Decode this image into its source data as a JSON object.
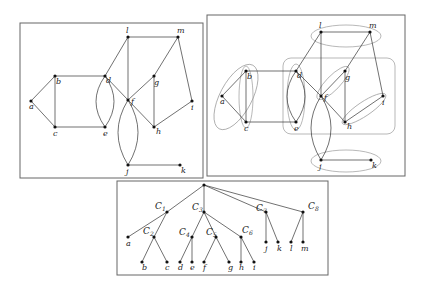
{
  "panels": {
    "left_graph": {
      "frame": {
        "x": 20,
        "y": 23,
        "w": 183,
        "h": 155
      },
      "nodes": [
        {
          "id": "a",
          "x": 31,
          "y": 101,
          "lx": -2,
          "ly": 8
        },
        {
          "id": "b",
          "x": 55,
          "y": 76,
          "lx": 1,
          "ly": 8
        },
        {
          "id": "c",
          "x": 55,
          "y": 127,
          "lx": -2,
          "ly": 9
        },
        {
          "id": "d",
          "x": 105,
          "y": 76,
          "lx": 1,
          "ly": 7
        },
        {
          "id": "e",
          "x": 105,
          "y": 127,
          "lx": -2,
          "ly": 9
        },
        {
          "id": "f",
          "x": 128,
          "y": 100,
          "lx": 3,
          "ly": 4
        },
        {
          "id": "g",
          "x": 154,
          "y": 76,
          "lx": 0,
          "ly": 9
        },
        {
          "id": "h",
          "x": 154,
          "y": 127,
          "lx": 2,
          "ly": 7
        },
        {
          "id": "i",
          "x": 192,
          "y": 101,
          "lx": -1,
          "ly": 9
        },
        {
          "id": "j",
          "x": 128,
          "y": 165,
          "lx": -2,
          "ly": 9
        },
        {
          "id": "k",
          "x": 180,
          "y": 165,
          "lx": 1,
          "ly": 8
        },
        {
          "id": "l",
          "x": 128,
          "y": 37,
          "lx": -2,
          "ly": -4
        },
        {
          "id": "m",
          "x": 178,
          "y": 37,
          "lx": -1,
          "ly": -4
        }
      ],
      "edges": [
        [
          "a",
          "b"
        ],
        [
          "a",
          "c"
        ],
        [
          "b",
          "c"
        ],
        [
          "b",
          "d"
        ],
        [
          "c",
          "e"
        ],
        [
          "d",
          "f"
        ],
        [
          "d",
          "l"
        ],
        [
          "l",
          "m"
        ],
        [
          "l",
          "f"
        ],
        [
          "f",
          "g"
        ],
        [
          "f",
          "h"
        ],
        [
          "g",
          "m"
        ],
        [
          "g",
          "h"
        ],
        [
          "h",
          "i"
        ],
        [
          "m",
          "i"
        ],
        [
          "j",
          "k"
        ]
      ],
      "curved_edges": [
        {
          "from": "d",
          "to": "e",
          "bend": -9
        },
        {
          "from": "d",
          "to": "e",
          "bend": 9
        },
        {
          "from": "f",
          "to": "j",
          "bend": -10
        },
        {
          "from": "f",
          "to": "j",
          "bend": 10
        }
      ]
    },
    "right_graph": {
      "frame": {
        "x": 207,
        "y": 15,
        "w": 198,
        "h": 161
      },
      "nodes": [
        {
          "id": "a",
          "x": 222,
          "y": 96,
          "lx": -2,
          "ly": 8
        },
        {
          "id": "b",
          "x": 246,
          "y": 71,
          "lx": 1,
          "ly": 8
        },
        {
          "id": "c",
          "x": 246,
          "y": 122,
          "lx": -2,
          "ly": 9
        },
        {
          "id": "d",
          "x": 296,
          "y": 71,
          "lx": 1,
          "ly": 7
        },
        {
          "id": "e",
          "x": 296,
          "y": 122,
          "lx": -2,
          "ly": 9
        },
        {
          "id": "f",
          "x": 321,
          "y": 96,
          "lx": 3,
          "ly": 4
        },
        {
          "id": "g",
          "x": 345,
          "y": 71,
          "lx": 0,
          "ly": 9
        },
        {
          "id": "h",
          "x": 345,
          "y": 122,
          "lx": 2,
          "ly": 7
        },
        {
          "id": "i",
          "x": 383,
          "y": 96,
          "lx": -1,
          "ly": 9
        },
        {
          "id": "j",
          "x": 321,
          "y": 160,
          "lx": -2,
          "ly": 9
        },
        {
          "id": "k",
          "x": 371,
          "y": 160,
          "lx": 1,
          "ly": 8
        },
        {
          "id": "l",
          "x": 321,
          "y": 32,
          "lx": -2,
          "ly": -4
        },
        {
          "id": "m",
          "x": 370,
          "y": 32,
          "lx": -1,
          "ly": -4
        }
      ],
      "edges": [
        [
          "a",
          "b"
        ],
        [
          "a",
          "c"
        ],
        [
          "b",
          "c"
        ],
        [
          "b",
          "d"
        ],
        [
          "c",
          "e"
        ],
        [
          "d",
          "f"
        ],
        [
          "d",
          "l"
        ],
        [
          "l",
          "m"
        ],
        [
          "l",
          "f"
        ],
        [
          "f",
          "g"
        ],
        [
          "f",
          "h"
        ],
        [
          "g",
          "m"
        ],
        [
          "g",
          "h"
        ],
        [
          "h",
          "i"
        ],
        [
          "m",
          "i"
        ],
        [
          "j",
          "k"
        ]
      ],
      "curved_edges": [
        {
          "from": "d",
          "to": "e",
          "bend": -9
        },
        {
          "from": "d",
          "to": "e",
          "bend": 9
        },
        {
          "from": "f",
          "to": "j",
          "bend": -10
        },
        {
          "from": "f",
          "to": "j",
          "bend": 10
        }
      ],
      "hulls": [
        {
          "type": "rect",
          "x": 283,
          "y": 58,
          "w": 112,
          "h": 76,
          "r": 8
        },
        {
          "type": "ellipse",
          "cx": 236,
          "cy": 97,
          "rx": 16,
          "ry": 36,
          "rot": 28
        },
        {
          "type": "ellipse",
          "cx": 246,
          "cy": 97,
          "rx": 7,
          "ry": 31,
          "rot": 0
        },
        {
          "type": "ellipse",
          "cx": 296,
          "cy": 97,
          "rx": 9,
          "ry": 33,
          "rot": 0
        },
        {
          "type": "ellipse",
          "cx": 333,
          "cy": 83,
          "rx": 7,
          "ry": 22,
          "rot": 44
        },
        {
          "type": "ellipse",
          "cx": 364,
          "cy": 109,
          "rx": 7,
          "ry": 26,
          "rot": 56
        },
        {
          "type": "ellipse",
          "cx": 346,
          "cy": 36,
          "rx": 35,
          "ry": 11,
          "rot": 0
        },
        {
          "type": "ellipse",
          "cx": 346,
          "cy": 161,
          "rx": 35,
          "ry": 11,
          "rot": 0
        }
      ]
    },
    "tree": {
      "frame": {
        "x": 117,
        "y": 181,
        "w": 211,
        "h": 94
      },
      "nodes": [
        {
          "id": "root",
          "x": 204,
          "y": 185,
          "label": "",
          "leaf": false
        },
        {
          "id": "C1",
          "x": 167,
          "y": 212,
          "label": "C",
          "sub": "1",
          "lx": -12,
          "ly": -3,
          "leaf": false
        },
        {
          "id": "C3",
          "x": 204,
          "y": 212,
          "label": "C",
          "sub": "3",
          "lx": -12,
          "ly": -2,
          "leaf": false
        },
        {
          "id": "C7",
          "x": 266,
          "y": 212,
          "label": "C",
          "sub": "7",
          "lx": -10,
          "ly": -1,
          "leaf": false
        },
        {
          "id": "C8",
          "x": 303,
          "y": 212,
          "label": "C",
          "sub": "8",
          "lx": 5,
          "ly": -3,
          "leaf": false
        },
        {
          "id": "a",
          "x": 128,
          "y": 237,
          "label": "a",
          "lx": -2,
          "ly": 9,
          "leaf": true
        },
        {
          "id": "C2",
          "x": 154,
          "y": 237,
          "label": "C",
          "sub": "2",
          "lx": -11,
          "ly": -3,
          "leaf": false
        },
        {
          "id": "C4",
          "x": 192,
          "y": 237,
          "label": "C",
          "sub": "4",
          "lx": -13,
          "ly": -2,
          "leaf": false
        },
        {
          "id": "C5",
          "x": 216,
          "y": 237,
          "label": "C",
          "sub": "5",
          "lx": -10,
          "ly": -2,
          "leaf": false
        },
        {
          "id": "C6",
          "x": 241,
          "y": 237,
          "label": "C",
          "sub": "6",
          "lx": 1,
          "ly": -4,
          "leaf": false
        },
        {
          "id": "j",
          "x": 266,
          "y": 242,
          "label": "j",
          "lx": -1,
          "ly": 9,
          "leaf": true
        },
        {
          "id": "k",
          "x": 278,
          "y": 242,
          "label": "k",
          "lx": -1,
          "ly": 9,
          "leaf": true
        },
        {
          "id": "l",
          "x": 291,
          "y": 242,
          "label": "l",
          "lx": -1,
          "ly": 9,
          "leaf": true
        },
        {
          "id": "m",
          "x": 303,
          "y": 242,
          "label": "m",
          "lx": -2,
          "ly": 9,
          "leaf": true
        },
        {
          "id": "b",
          "x": 142,
          "y": 262,
          "label": "b",
          "lx": 0,
          "ly": 8,
          "leaf": true
        },
        {
          "id": "c",
          "x": 167,
          "y": 262,
          "label": "c",
          "lx": -2,
          "ly": 8,
          "leaf": true
        },
        {
          "id": "d",
          "x": 180,
          "y": 262,
          "label": "d",
          "lx": -2,
          "ly": 8,
          "leaf": true
        },
        {
          "id": "e",
          "x": 192,
          "y": 262,
          "label": "e",
          "lx": -2,
          "ly": 8,
          "leaf": true
        },
        {
          "id": "f",
          "x": 204,
          "y": 262,
          "label": "f",
          "lx": -1,
          "ly": 8,
          "leaf": true
        },
        {
          "id": "g",
          "x": 229,
          "y": 262,
          "label": "g",
          "lx": -1,
          "ly": 8,
          "leaf": true
        },
        {
          "id": "h",
          "x": 241,
          "y": 262,
          "label": "h",
          "lx": -2,
          "ly": 8,
          "leaf": true
        },
        {
          "id": "i",
          "x": 254,
          "y": 262,
          "label": "i",
          "lx": -1,
          "ly": 8,
          "leaf": true
        }
      ],
      "edges": [
        [
          "root",
          "C1"
        ],
        [
          "root",
          "C3"
        ],
        [
          "root",
          "C7"
        ],
        [
          "root",
          "C8"
        ],
        [
          "C1",
          "a"
        ],
        [
          "C1",
          "C2"
        ],
        [
          "C2",
          "b"
        ],
        [
          "C2",
          "c"
        ],
        [
          "C3",
          "C4"
        ],
        [
          "C3",
          "C5"
        ],
        [
          "C3",
          "C6"
        ],
        [
          "C4",
          "d"
        ],
        [
          "C4",
          "e"
        ],
        [
          "C5",
          "f"
        ],
        [
          "C5",
          "g"
        ],
        [
          "C6",
          "h"
        ],
        [
          "C6",
          "i"
        ],
        [
          "C7",
          "j"
        ],
        [
          "C7",
          "k"
        ],
        [
          "C8",
          "l"
        ],
        [
          "C8",
          "m"
        ]
      ]
    }
  }
}
